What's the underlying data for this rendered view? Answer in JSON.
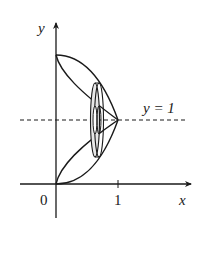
{
  "diagram": {
    "type": "solid-of-revolution",
    "axis_labels": {
      "x": "x",
      "y": "y"
    },
    "tick_labels": {
      "origin": "0",
      "x_one": "1"
    },
    "axis_of_rotation_label": "y = 1",
    "colors": {
      "stroke": "#1a1a1a",
      "background": "#ffffff"
    }
  }
}
